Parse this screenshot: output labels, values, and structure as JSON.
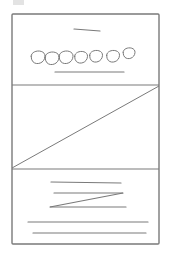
{
  "diagram": {
    "type": "hand-drawn-wireframe",
    "canvas": {
      "width": 171,
      "height": 258,
      "background": "#ffffff"
    },
    "stroke_color": "#7a7a7a",
    "corner_mark": {
      "x": 13,
      "y": 0,
      "w": 11,
      "h": 5,
      "color": "#d0d0d0"
    },
    "frame": {
      "x": 12,
      "y": 14,
      "w": 147,
      "h": 230
    },
    "sections": [
      {
        "name": "header-section",
        "y0": 14,
        "y1": 85,
        "title_line": {
          "x1": 74,
          "y1": 29,
          "x2": 100,
          "y2": 31
        },
        "circles": [
          {
            "cx": 38,
            "cy": 57,
            "r": 7
          },
          {
            "cx": 52,
            "cy": 58,
            "r": 7
          },
          {
            "cx": 66,
            "cy": 57,
            "r": 7
          },
          {
            "cx": 81,
            "cy": 57,
            "r": 6.5
          },
          {
            "cx": 96,
            "cy": 56,
            "r": 6.5
          },
          {
            "cx": 113,
            "cy": 56,
            "r": 6.5
          },
          {
            "cx": 129,
            "cy": 53,
            "r": 6
          }
        ],
        "caption_line": {
          "x1": 55,
          "y1": 72,
          "x2": 124,
          "y2": 72
        }
      },
      {
        "name": "image-placeholder-section",
        "y0": 85,
        "y1": 169,
        "diagonal": {
          "x1": 12,
          "y1": 168,
          "x2": 159,
          "y2": 86
        }
      },
      {
        "name": "text-section",
        "y0": 169,
        "y1": 244,
        "lines": [
          {
            "x1": 51,
            "y1": 182,
            "x2": 121,
            "y2": 183
          },
          {
            "x1": 54,
            "y1": 193,
            "x2": 123,
            "y2": 193
          },
          {
            "x1": 50,
            "y1": 207,
            "x2": 126,
            "y2": 207
          },
          {
            "x1": 28,
            "y1": 222,
            "x2": 148,
            "y2": 222
          },
          {
            "x1": 33,
            "y1": 233,
            "x2": 146,
            "y2": 233
          }
        ],
        "zigzag": {
          "x1": 50,
          "y1": 207,
          "x2": 123,
          "y2": 193
        }
      }
    ],
    "labels": {
      "title": "",
      "caption": ""
    }
  }
}
